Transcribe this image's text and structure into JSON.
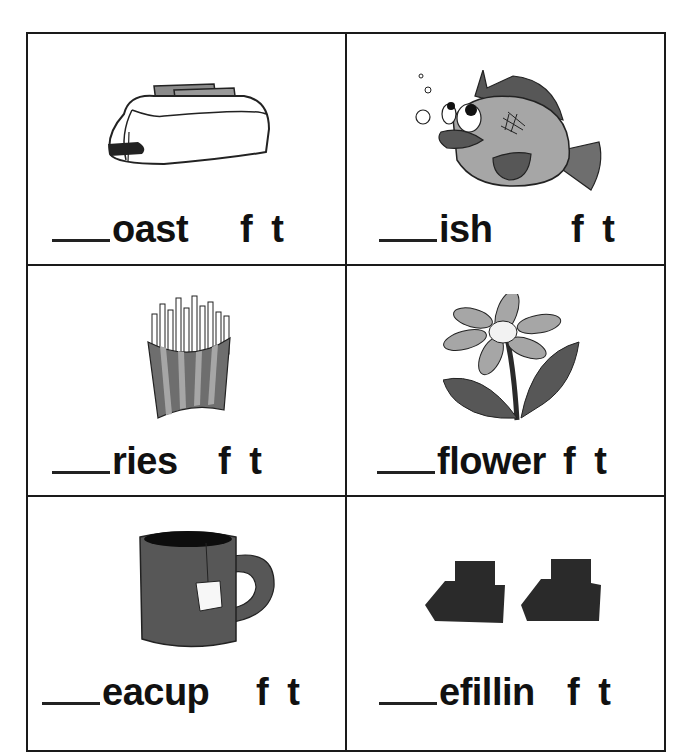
{
  "worksheet": {
    "answer_options": [
      "f",
      "t"
    ],
    "cells": [
      {
        "picture": "toaster",
        "word_stem": "oast",
        "options": "f t"
      },
      {
        "picture": "fish",
        "word_stem": "ish",
        "options": "f t"
      },
      {
        "picture": "french-fries",
        "word_stem": "ries",
        "options": "f t"
      },
      {
        "picture": "flower",
        "word_stem": "flower",
        "options": "f t"
      },
      {
        "picture": "teacup",
        "word_stem": "eacup",
        "options": "f t"
      },
      {
        "picture": "teeth-fillings",
        "word_stem": "efillin",
        "options": "f t"
      }
    ]
  },
  "colors": {
    "border": "#1a1a1a",
    "light_gray": "#a6a6a6",
    "mid_gray": "#6e6e6e",
    "dark_gray": "#575757",
    "near_black": "#2a2a2a"
  }
}
